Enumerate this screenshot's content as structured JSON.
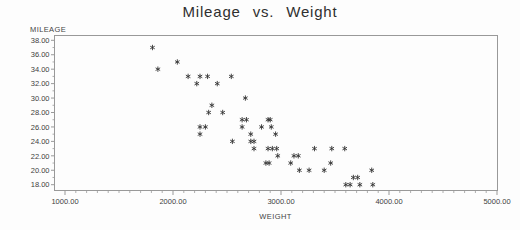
{
  "colors": {
    "background": "#fdfdfd",
    "text": "#3d3d3d",
    "axis": "#999999",
    "marker": "#333333"
  },
  "chart_data": {
    "type": "scatter",
    "title": "Mileage vs. Weight",
    "ylabel": "MILEAGE",
    "xlabel": "WEIGHT",
    "marker": "*",
    "grid": false,
    "legend": null,
    "xlim": [
      900,
      5000
    ],
    "ylim": [
      17.3,
      38.7
    ],
    "x_ticks": [
      1000,
      2000,
      3000,
      4000,
      5000
    ],
    "x_tick_labels": [
      "1000.00",
      "2000.00",
      "3000.00",
      "4000.00",
      "5000.00"
    ],
    "x_minor_step": 100,
    "y_ticks": [
      38,
      36,
      34,
      32,
      30,
      28,
      26,
      24,
      22,
      20,
      18
    ],
    "y_tick_labels": [
      "38.00",
      "36.00",
      "34.00",
      "32.00",
      "30.00",
      "28.00",
      "26.00",
      "24.00",
      "22.00",
      "20.00",
      "18.00"
    ],
    "y_minor_step": 1,
    "points_xy": [
      [
        1810,
        37
      ],
      [
        2040,
        35
      ],
      [
        1860,
        34
      ],
      [
        2140,
        33
      ],
      [
        2250,
        33
      ],
      [
        2320,
        33
      ],
      [
        2540,
        33
      ],
      [
        2220,
        32
      ],
      [
        2410,
        32
      ],
      [
        2670,
        30
      ],
      [
        2360,
        29
      ],
      [
        2330,
        28
      ],
      [
        2460,
        28
      ],
      [
        2640,
        27
      ],
      [
        2680,
        27
      ],
      [
        2880,
        27
      ],
      [
        2900,
        27
      ],
      [
        2250,
        26
      ],
      [
        2300,
        26
      ],
      [
        2640,
        26
      ],
      [
        2820,
        26
      ],
      [
        2910,
        26
      ],
      [
        2250,
        25
      ],
      [
        2720,
        25
      ],
      [
        2950,
        25
      ],
      [
        2550,
        24
      ],
      [
        2720,
        24
      ],
      [
        2750,
        24
      ],
      [
        2750,
        23
      ],
      [
        2880,
        23
      ],
      [
        2920,
        23
      ],
      [
        2960,
        23
      ],
      [
        3310,
        23
      ],
      [
        3470,
        23
      ],
      [
        3590,
        23
      ],
      [
        2970,
        22
      ],
      [
        3120,
        22
      ],
      [
        3160,
        22
      ],
      [
        2860,
        21
      ],
      [
        2890,
        21
      ],
      [
        3090,
        21
      ],
      [
        3460,
        21
      ],
      [
        3170,
        20
      ],
      [
        3260,
        20
      ],
      [
        3400,
        20
      ],
      [
        3840,
        20
      ],
      [
        3670,
        19
      ],
      [
        3710,
        19
      ],
      [
        3600,
        18
      ],
      [
        3640,
        18
      ],
      [
        3730,
        18
      ],
      [
        3850,
        18
      ]
    ]
  }
}
